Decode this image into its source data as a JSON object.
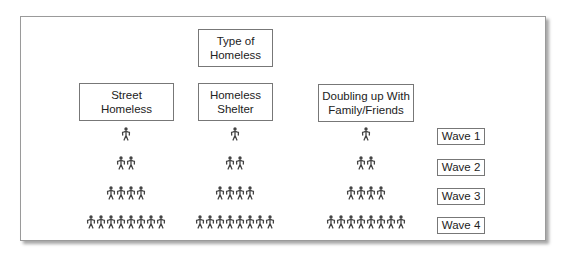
{
  "diagram": {
    "root": {
      "label": "Type of\nHomeless"
    },
    "categories": [
      {
        "label": "Street\nHomeless",
        "people_per_wave": [
          1,
          2,
          4,
          8
        ]
      },
      {
        "label": "Homeless\nShelter",
        "people_per_wave": [
          1,
          2,
          4,
          8
        ]
      },
      {
        "label": "Doubling up With\nFamily/Friends",
        "people_per_wave": [
          1,
          2,
          4,
          8
        ]
      }
    ],
    "waves": [
      {
        "label": "Wave 1",
        "count": 1
      },
      {
        "label": "Wave 2",
        "count": 2
      },
      {
        "label": "Wave 3",
        "count": 4
      },
      {
        "label": "Wave 4",
        "count": 8
      }
    ],
    "icon": "person-icon",
    "colors": {
      "border": "#777777",
      "icon": "#444444",
      "text": "#222222"
    }
  }
}
